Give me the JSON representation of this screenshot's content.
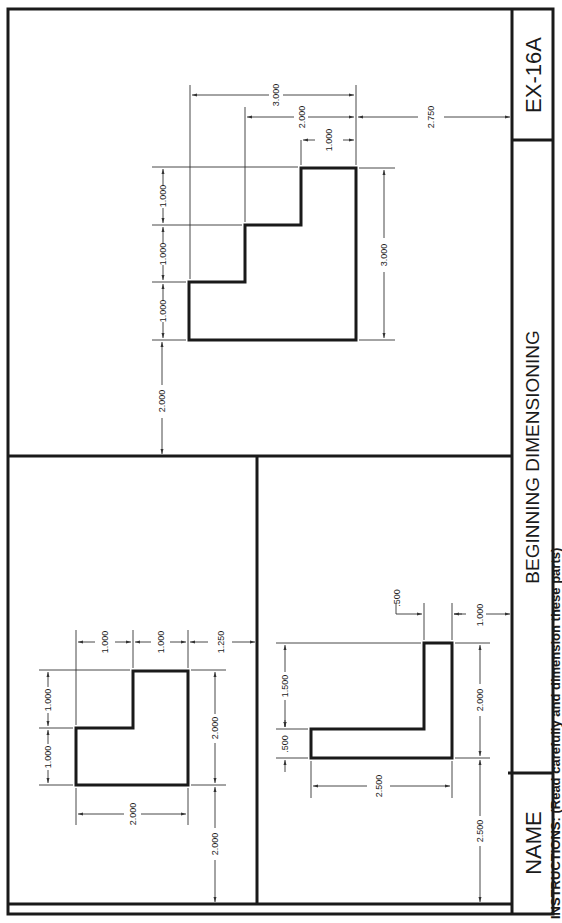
{
  "title_block": {
    "drawing_number": "EX-16A",
    "title": "BEGINNING DIMENSIONING",
    "name_label": "NAME",
    "instructions": "INSTRUCTIONS: (Read carefully and dimension these parts)"
  },
  "drawings": {
    "stepped_part": {
      "horizontal_steps": [
        "1.000",
        "1.000",
        "1.000"
      ],
      "offset_from_border": "2.000",
      "overall_height": "3.000",
      "baseline_dims": [
        "3.000",
        "2.000",
        "1.000"
      ],
      "offset_from_title": "2.750"
    },
    "l_part_square": {
      "top_steps": [
        "1.000",
        "1.000"
      ],
      "top_offset": "1.250",
      "left_steps": [
        "1.000",
        "1.000"
      ],
      "bottom_width": "2.000",
      "right_height": "2.000",
      "bottom_offset": "2.000"
    },
    "l_part_angle": {
      "thickness_left": ".500",
      "upper_length": "1.500",
      "flange_thickness": ".500",
      "flange_offset": "1.000",
      "bottom_width": "2.500",
      "right_height": "2.000",
      "bottom_offset": "2.500"
    }
  }
}
